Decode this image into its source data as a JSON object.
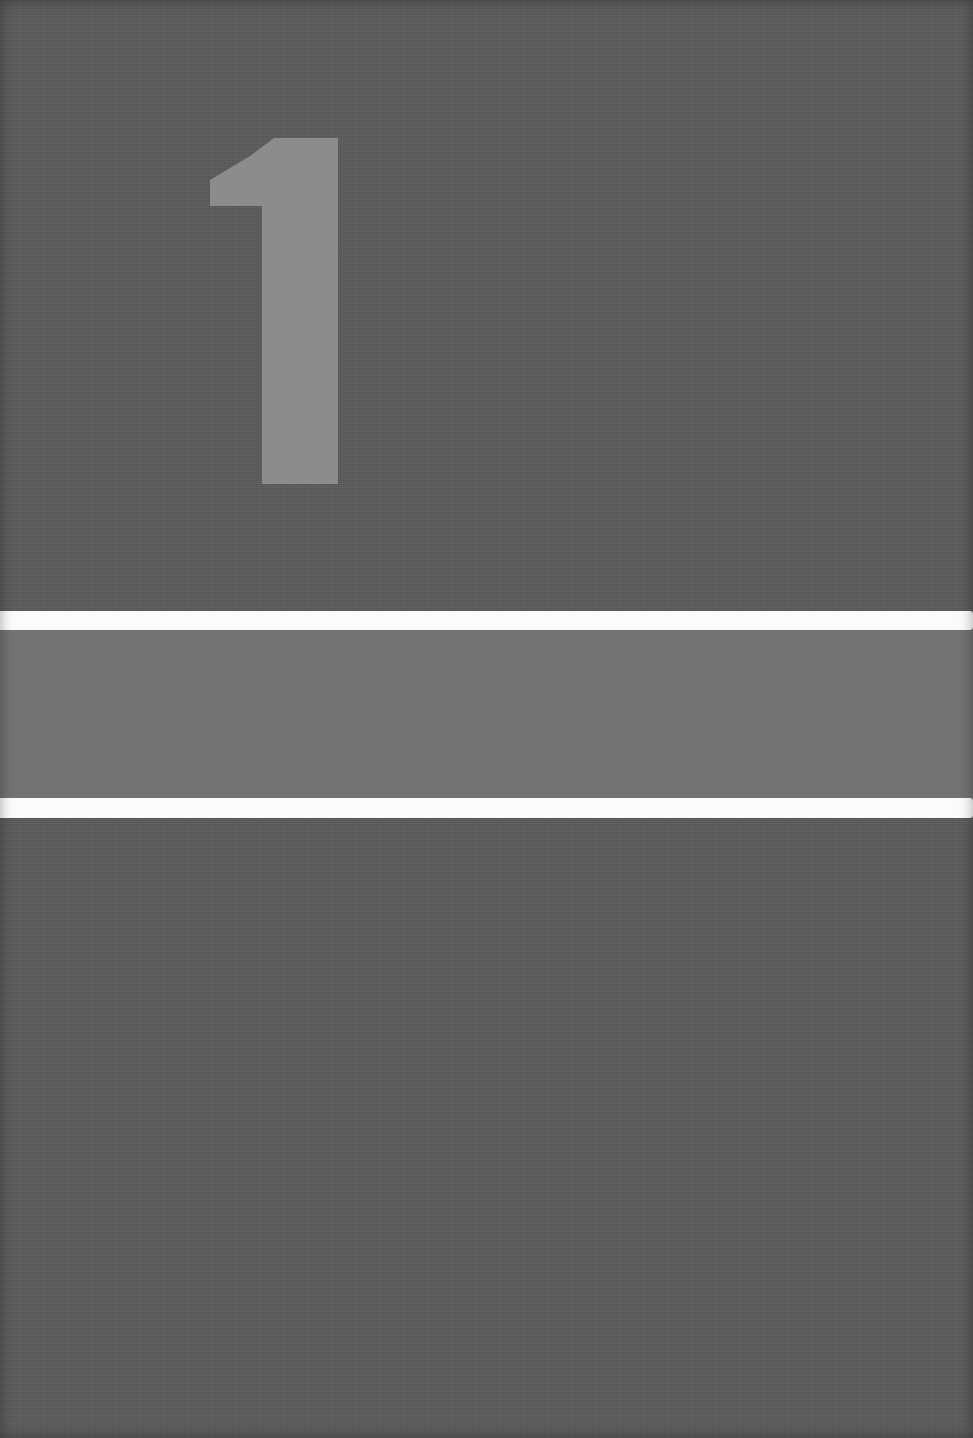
{
  "cover": {
    "numeral": "1",
    "colors": {
      "background": "#5b5b5b",
      "numeral": "#8c8c8c",
      "stripe": "#fbfbfb",
      "band": "#727272"
    }
  }
}
